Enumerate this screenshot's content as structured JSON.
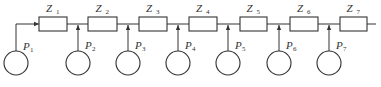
{
  "diagram": {
    "type": "radial-feeder",
    "impedances": [
      {
        "label": "Z",
        "sub": "1",
        "x1": 39,
        "x2": 67
      },
      {
        "label": "Z",
        "sub": "2",
        "x1": 88,
        "x2": 117
      },
      {
        "label": "Z",
        "sub": "3",
        "x1": 139,
        "x2": 167
      },
      {
        "label": "Z",
        "sub": "4",
        "x1": 189,
        "x2": 217
      },
      {
        "label": "Z",
        "sub": "5",
        "x1": 240,
        "x2": 267
      },
      {
        "label": "Z",
        "sub": "6",
        "x1": 290,
        "x2": 318
      },
      {
        "label": "Z",
        "sub": "7",
        "x1": 340,
        "x2": 367
      }
    ],
    "sources": [
      {
        "label": "P",
        "sub": "1",
        "x": 16
      },
      {
        "label": "P",
        "sub": "2",
        "x": 78
      },
      {
        "label": "P",
        "sub": "3",
        "x": 128
      },
      {
        "label": "P",
        "sub": "4",
        "x": 178
      },
      {
        "label": "P",
        "sub": "5",
        "x": 228
      },
      {
        "label": "P",
        "sub": "6",
        "x": 279
      },
      {
        "label": "P",
        "sub": "7",
        "x": 329
      }
    ],
    "wire_y": 24,
    "wire_end_x": 376,
    "colors": {
      "stroke": "#333333"
    }
  }
}
